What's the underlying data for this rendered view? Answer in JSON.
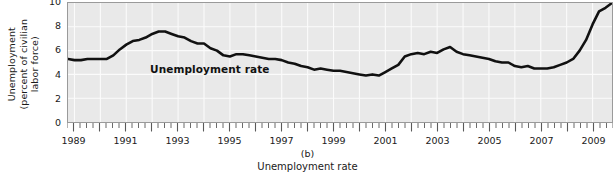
{
  "chart_data": {
    "type": "line",
    "title": "Unemployment rate",
    "panel_label": "(b)",
    "caption": "Unemployment rate",
    "xlabel": "",
    "ylabel": "Unemployment (percent of civilian labor force)",
    "ylabel_lines": [
      "Unemployment",
      "(percent of civilian",
      "labor force)"
    ],
    "series_annotation": "Unemployment rate",
    "grid": true,
    "legend_position": "inline-annotation",
    "xlim": [
      1988.75,
      2009.75
    ],
    "ylim": [
      0,
      10
    ],
    "ytick_labels": [
      "0",
      "2",
      "4",
      "6",
      "8",
      "10"
    ],
    "ytick_values": [
      0,
      2,
      4,
      6,
      8,
      10
    ],
    "xtick_labels": [
      "1989",
      "1991",
      "1993",
      "1995",
      "1997",
      "1999",
      "2001",
      "2003",
      "2005",
      "2007",
      "2009"
    ],
    "xtick_values": [
      1989,
      1991,
      1993,
      1995,
      1997,
      1999,
      2001,
      2003,
      2005,
      2007,
      2009
    ],
    "minor_tick_interval_years": 0.25,
    "series": [
      {
        "name": "Unemployment rate",
        "color": "#111111",
        "x": [
          1988.75,
          1989.0,
          1989.25,
          1989.5,
          1989.75,
          1990.0,
          1990.25,
          1990.5,
          1990.75,
          1991.0,
          1991.25,
          1991.5,
          1991.75,
          1992.0,
          1992.25,
          1992.5,
          1992.75,
          1993.0,
          1993.25,
          1993.5,
          1993.75,
          1994.0,
          1994.25,
          1994.5,
          1994.75,
          1995.0,
          1995.25,
          1995.5,
          1995.75,
          1996.0,
          1996.25,
          1996.5,
          1996.75,
          1997.0,
          1997.25,
          1997.5,
          1997.75,
          1998.0,
          1998.25,
          1998.5,
          1998.75,
          1999.0,
          1999.25,
          1999.5,
          1999.75,
          2000.0,
          2000.25,
          2000.5,
          2000.75,
          2001.0,
          2001.25,
          2001.5,
          2001.75,
          2002.0,
          2002.25,
          2002.5,
          2002.75,
          2003.0,
          2003.25,
          2003.5,
          2003.75,
          2004.0,
          2004.25,
          2004.5,
          2004.75,
          2005.0,
          2005.25,
          2005.5,
          2005.75,
          2006.0,
          2006.25,
          2006.5,
          2006.75,
          2007.0,
          2007.25,
          2007.5,
          2007.75,
          2008.0,
          2008.25,
          2008.5,
          2008.75,
          2009.0,
          2009.25,
          2009.5,
          2009.75
        ],
        "y": [
          5.3,
          5.2,
          5.2,
          5.3,
          5.3,
          5.3,
          5.3,
          5.6,
          6.1,
          6.5,
          6.8,
          6.9,
          7.1,
          7.4,
          7.6,
          7.6,
          7.4,
          7.2,
          7.1,
          6.8,
          6.6,
          6.6,
          6.2,
          6.0,
          5.6,
          5.5,
          5.7,
          5.7,
          5.6,
          5.5,
          5.4,
          5.3,
          5.3,
          5.2,
          5.0,
          4.9,
          4.7,
          4.6,
          4.4,
          4.5,
          4.4,
          4.3,
          4.3,
          4.2,
          4.1,
          4.0,
          3.9,
          4.0,
          3.9,
          4.2,
          4.5,
          4.8,
          5.5,
          5.7,
          5.8,
          5.7,
          5.9,
          5.8,
          6.1,
          6.3,
          5.9,
          5.7,
          5.6,
          5.5,
          5.4,
          5.3,
          5.1,
          5.0,
          5.0,
          4.7,
          4.6,
          4.7,
          4.5,
          4.5,
          4.5,
          4.6,
          4.8,
          5.0,
          5.3,
          6.0,
          6.9,
          8.2,
          9.3,
          9.6,
          10.0
        ]
      }
    ]
  }
}
